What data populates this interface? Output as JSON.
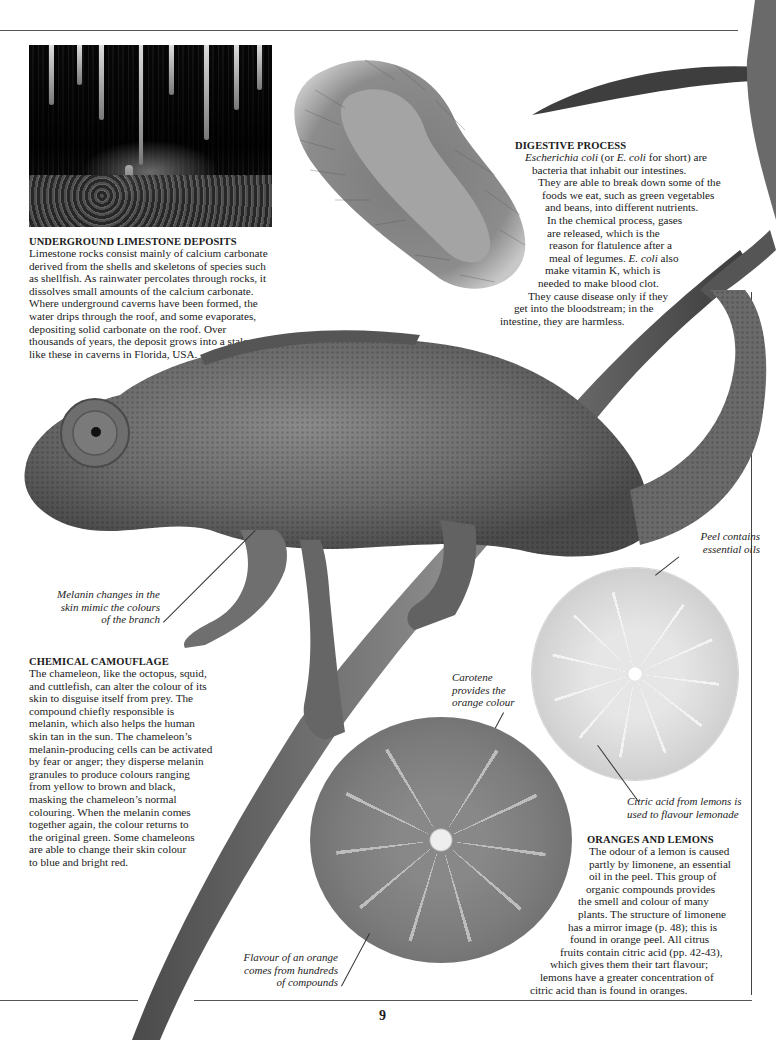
{
  "page": {
    "number": "9"
  },
  "sections": {
    "limestone": {
      "heading": "UNDERGROUND LIMESTONE DEPOSITS",
      "lines": [
        "Limestone rocks consist mainly of calcium carbonate",
        "derived from the shells and skeletons of species such",
        "as shellfish. As rainwater percolates through rocks, it",
        "dissolves small amounts of the calcium carbonate.",
        "Where underground caverns have been formed, the",
        "water drips through the roof, and some evaporates,",
        "depositing solid carbonate on the roof. Over",
        "thousands of years, the deposit grows into a stalactite",
        "like these in caverns in Florida, USA."
      ]
    },
    "digestive": {
      "heading": "DIGESTIVE PROCESS",
      "lines": [
        "Escherichia coli (or E. coli for short) are",
        "bacteria that inhabit our intestines.",
        "They are able to break down some of the",
        "foods we eat, such as green vegetables",
        "and beans, into different nutrients.",
        "In the chemical process, gases",
        "are released, which is the",
        "reason for flatulence after a",
        "meal of legumes. E. coli also",
        "make vitamin K, which is",
        "needed to make blood clot.",
        "They cause disease only if they",
        "get into the bloodstream; in the",
        "intestine, they are harmless."
      ]
    },
    "camouflage": {
      "heading": "CHEMICAL CAMOUFLAGE",
      "lines": [
        "The chameleon, like the octopus, squid,",
        "and cuttlefish, can alter the colour of its",
        "skin to disguise itself from prey. The",
        "compound chiefly responsible is",
        "melanin, which also helps the human",
        "skin tan in the sun. The chameleon’s",
        "melanin-producing cells can be activated",
        "by fear or anger; they disperse melanin",
        "granules to produce colours ranging",
        "from yellow to brown and black,",
        "masking the chameleon’s normal",
        "colouring. When the melanin comes",
        "together again, the colour returns to",
        "the original green. Some chameleons",
        "are able to change their skin colour",
        "to blue and bright red."
      ]
    },
    "citrus": {
      "heading": "ORANGES AND LEMONS",
      "lines": [
        "The odour of a lemon is caused",
        "partly by limonene, an essential",
        "oil in the peel. This group of",
        "organic compounds provides",
        "the smell and colour of many",
        "plants. The structure of limonene",
        "has a mirror image (p. 48); this is",
        "found in orange peel. All citrus",
        "fruits contain citric acid (pp. 42-43),",
        "which gives them their tart flavour;",
        "lemons have a greater concentration of",
        "citric acid than is found in oranges."
      ]
    }
  },
  "captions": {
    "melanin": [
      "Melanin changes in the",
      "skin mimic the colours",
      "of the branch"
    ],
    "carotene": [
      "Carotene",
      "provides the",
      "orange colour"
    ],
    "peel": [
      "Peel contains",
      "essential oils"
    ],
    "citric": [
      "Citric acid from lemons is",
      "used to flavour lemonade"
    ],
    "flavour": [
      "Flavour of an orange",
      "comes from hundreds",
      "of compounds"
    ]
  },
  "images": {
    "cave": "stalactites-photo",
    "bacterium": "e-coli-micrograph",
    "chameleon": "chameleon-on-branch",
    "lemon": "lemon-half",
    "orange": "orange-half",
    "leaf": "leaf"
  }
}
